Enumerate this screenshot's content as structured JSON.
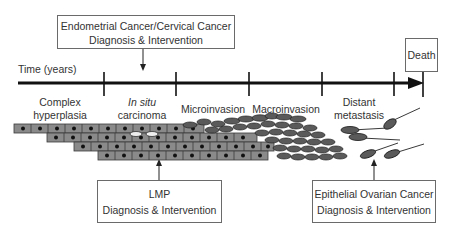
{
  "diagram": {
    "type": "cancer-progression-timeline",
    "timeline": {
      "label": "Time (years)",
      "stages": [
        {
          "label_line1": "Complex",
          "label_line2": "hyperplasia",
          "italic": false
        },
        {
          "label_line1": "In situ",
          "label_line2": "carcinoma",
          "italic_line1": true
        },
        {
          "label_line1": "Microinvasion",
          "label_line2": ""
        },
        {
          "label_line1": "Macroinvasion",
          "label_line2": ""
        },
        {
          "label_line1": "Distant",
          "label_line2": "metastasis"
        }
      ],
      "end_label": "Death"
    },
    "callouts": {
      "endometrial": {
        "line1": "Endometrial Cancer/Cervical Cancer",
        "line2": "Diagnosis & Intervention"
      },
      "lmp": {
        "line1": "LMP",
        "line2": "Diagnosis & Intervention"
      },
      "ovarian": {
        "line1": "Epithelial Ovarian Cancer",
        "line2": "Diagnosis & Intervention"
      }
    },
    "colors": {
      "line": "#111111",
      "box_border": "#6a6a6a",
      "cell_fill": "#8a8a8a",
      "cell_border": "#3a3a3a",
      "nucleus": "#111111",
      "invasive_cell": "#5a5a5a"
    }
  }
}
